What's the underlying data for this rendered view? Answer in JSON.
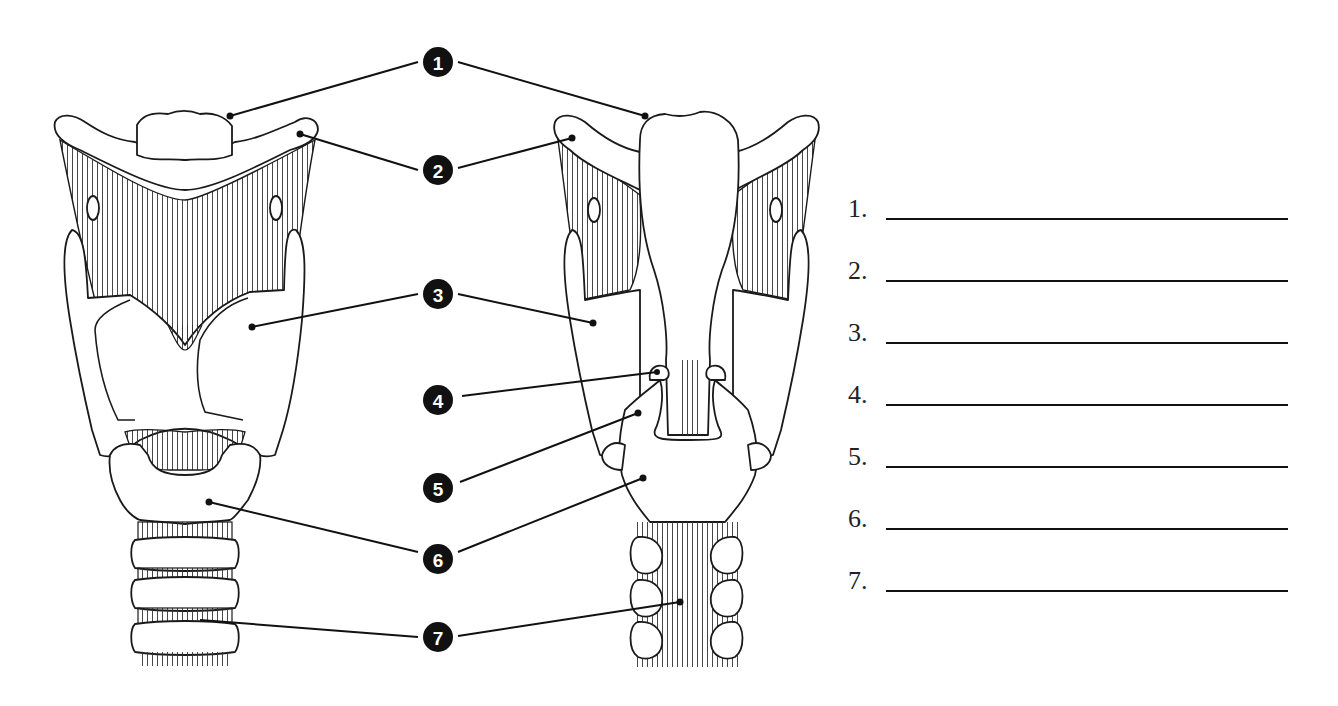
{
  "diagram": {
    "views": [
      {
        "id": "anterior",
        "label": "Anterior view"
      },
      {
        "id": "posterior",
        "label": "Posterior view"
      }
    ],
    "callouts": [
      {
        "number": "1"
      },
      {
        "number": "2"
      },
      {
        "number": "3"
      },
      {
        "number": "4"
      },
      {
        "number": "5"
      },
      {
        "number": "6"
      },
      {
        "number": "7"
      }
    ]
  },
  "answer_sheet": {
    "items": [
      {
        "label": "1.",
        "value": ""
      },
      {
        "label": "2.",
        "value": ""
      },
      {
        "label": "3.",
        "value": ""
      },
      {
        "label": "4.",
        "value": ""
      },
      {
        "label": "5.",
        "value": ""
      },
      {
        "label": "6.",
        "value": ""
      },
      {
        "label": "7.",
        "value": ""
      }
    ]
  },
  "colors": {
    "ink": "#111111",
    "background": "#ffffff"
  }
}
